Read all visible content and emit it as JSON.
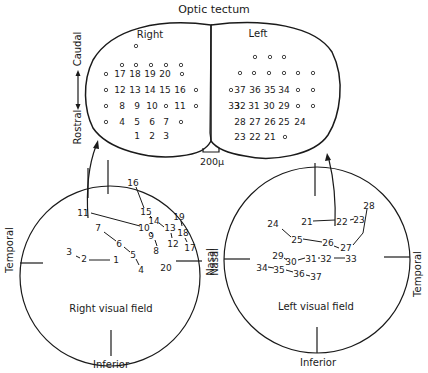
{
  "title": "Optic tectum",
  "tectum": {
    "right_label": "Right",
    "left_label": "Left",
    "axis_caudal": "Caudal",
    "axis_rostral": "Rostral",
    "scale_label": "200μ",
    "right_rows": [
      {
        "y": 49,
        "items": [
          {
            "x": 136,
            "t": "o"
          }
        ]
      },
      {
        "y": 68,
        "items": [
          {
            "x": 122,
            "t": "o"
          },
          {
            "x": 136,
            "t": "o"
          },
          {
            "x": 151,
            "t": "o"
          },
          {
            "x": 166,
            "t": "o"
          },
          {
            "x": 181,
            "t": "o"
          }
        ]
      },
      {
        "y": 77,
        "items": [
          {
            "x": 106,
            "t": "o"
          },
          {
            "x": 120,
            "t": "17"
          },
          {
            "x": 135,
            "t": "18"
          },
          {
            "x": 150,
            "t": "19"
          },
          {
            "x": 165,
            "t": "20"
          },
          {
            "x": 182,
            "t": "o"
          }
        ]
      },
      {
        "y": 93,
        "items": [
          {
            "x": 106,
            "t": "o"
          },
          {
            "x": 120,
            "t": "12"
          },
          {
            "x": 135,
            "t": "13"
          },
          {
            "x": 150,
            "t": "14"
          },
          {
            "x": 165,
            "t": "15"
          },
          {
            "x": 180,
            "t": "16"
          },
          {
            "x": 196,
            "t": "o"
          }
        ]
      },
      {
        "y": 109,
        "items": [
          {
            "x": 106,
            "t": "o"
          },
          {
            "x": 122,
            "t": "8"
          },
          {
            "x": 137,
            "t": "9"
          },
          {
            "x": 152,
            "t": "10"
          },
          {
            "x": 166,
            "t": "o"
          },
          {
            "x": 180,
            "t": "11"
          },
          {
            "x": 196,
            "t": "o"
          }
        ]
      },
      {
        "y": 125,
        "items": [
          {
            "x": 106,
            "t": "o"
          },
          {
            "x": 122,
            "t": "4"
          },
          {
            "x": 137,
            "t": "5"
          },
          {
            "x": 152,
            "t": "6"
          },
          {
            "x": 166,
            "t": "7"
          },
          {
            "x": 181,
            "t": "o"
          }
        ]
      },
      {
        "y": 139,
        "items": [
          {
            "x": 137,
            "t": "1"
          },
          {
            "x": 152,
            "t": "2"
          },
          {
            "x": 166,
            "t": "3"
          }
        ]
      }
    ],
    "left_rows": [
      {
        "y": 60,
        "items": [
          {
            "x": 255,
            "t": "o"
          },
          {
            "x": 270,
            "t": "o"
          },
          {
            "x": 284,
            "t": "o"
          }
        ]
      },
      {
        "y": 76,
        "items": [
          {
            "x": 240,
            "t": "o"
          },
          {
            "x": 254,
            "t": "o"
          },
          {
            "x": 269,
            "t": "o"
          },
          {
            "x": 284,
            "t": "o"
          },
          {
            "x": 298,
            "t": "o"
          },
          {
            "x": 313,
            "t": "o"
          }
        ]
      },
      {
        "y": 93,
        "items": [
          {
            "x": 231,
            "t": "o"
          },
          {
            "x": 240,
            "t": "37"
          },
          {
            "x": 255,
            "t": "36"
          },
          {
            "x": 270,
            "t": "35"
          },
          {
            "x": 284,
            "t": "34"
          },
          {
            "x": 298,
            "t": "o"
          },
          {
            "x": 313,
            "t": "o"
          }
        ]
      },
      {
        "y": 109,
        "items": [
          {
            "x": 240,
            "t": "32"
          },
          {
            "x": 254,
            "t": "31"
          },
          {
            "x": 269,
            "t": "30"
          },
          {
            "x": 284,
            "t": "29"
          },
          {
            "x": 298,
            "t": "o"
          },
          {
            "x": 313,
            "t": "o"
          }
        ]
      },
      {
        "y": 125,
        "items": [
          {
            "x": 240,
            "t": "28"
          },
          {
            "x": 255,
            "t": "27"
          },
          {
            "x": 270,
            "t": "26"
          },
          {
            "x": 284,
            "t": "25"
          },
          {
            "x": 300,
            "t": "24"
          },
          {
            "x": 299,
            "t": ""
          }
        ]
      },
      {
        "y": 140,
        "items": [
          {
            "x": 240,
            "t": "23"
          },
          {
            "x": 255,
            "t": "22"
          },
          {
            "x": 270,
            "t": "21"
          },
          {
            "x": 285,
            "t": "o"
          }
        ]
      }
    ],
    "left_extra": [
      {
        "x": 234,
        "y": 109,
        "t": "33"
      }
    ]
  },
  "right_field": {
    "label": "Right visual field",
    "temporal": "Temporal",
    "nasal": "Nasal",
    "inferior": "Inferior",
    "points": [
      {
        "n": "1",
        "x": 116,
        "y": 260
      },
      {
        "n": "2",
        "x": 84,
        "y": 259
      },
      {
        "n": "3",
        "x": 69,
        "y": 252
      },
      {
        "n": "4",
        "x": 141,
        "y": 270
      },
      {
        "n": "5",
        "x": 133,
        "y": 255
      },
      {
        "n": "6",
        "x": 119,
        "y": 244
      },
      {
        "n": "7",
        "x": 98,
        "y": 228
      },
      {
        "n": "8",
        "x": 156,
        "y": 251
      },
      {
        "n": "9",
        "x": 151,
        "y": 236
      },
      {
        "n": "10",
        "x": 144,
        "y": 228
      },
      {
        "n": "11",
        "x": 83,
        "y": 213
      },
      {
        "n": "12",
        "x": 173,
        "y": 244
      },
      {
        "n": "13",
        "x": 170,
        "y": 228
      },
      {
        "n": "14",
        "x": 154,
        "y": 221
      },
      {
        "n": "15",
        "x": 146,
        "y": 212
      },
      {
        "n": "16",
        "x": 133,
        "y": 183
      },
      {
        "n": "17",
        "x": 190,
        "y": 248
      },
      {
        "n": "18",
        "x": 183,
        "y": 233
      },
      {
        "n": "19",
        "x": 179,
        "y": 217
      },
      {
        "n": "20",
        "x": 166,
        "y": 268
      }
    ],
    "segments": [
      [
        76,
        256,
        80,
        258
      ],
      [
        89,
        260,
        110,
        260
      ],
      [
        104,
        232,
        116,
        241
      ],
      [
        124,
        247,
        130,
        252
      ],
      [
        136,
        259,
        139,
        265
      ],
      [
        91,
        213,
        140,
        226
      ],
      [
        150,
        232,
        152,
        234
      ],
      [
        155,
        240,
        157,
        246
      ],
      [
        136,
        187,
        144,
        208
      ],
      [
        150,
        216,
        152,
        218
      ],
      [
        159,
        223,
        164,
        227
      ],
      [
        171,
        233,
        172,
        238
      ],
      [
        181,
        221,
        182,
        226
      ],
      [
        185,
        238,
        187,
        242
      ]
    ]
  },
  "left_field": {
    "label": "Left visual field",
    "nasal": "Nasal",
    "temporal": "Temporal",
    "inferior": "Inferior",
    "points": [
      {
        "n": "21",
        "x": 307,
        "y": 222
      },
      {
        "n": "22",
        "x": 342,
        "y": 222
      },
      {
        "n": "23",
        "x": 359,
        "y": 220
      },
      {
        "n": "24",
        "x": 273,
        "y": 224
      },
      {
        "n": "25",
        "x": 297,
        "y": 240
      },
      {
        "n": "26",
        "x": 328,
        "y": 243
      },
      {
        "n": "27",
        "x": 346,
        "y": 248
      },
      {
        "n": "28",
        "x": 369,
        "y": 206
      },
      {
        "n": "29",
        "x": 278,
        "y": 256
      },
      {
        "n": "30",
        "x": 291,
        "y": 262
      },
      {
        "n": "31",
        "x": 311,
        "y": 259
      },
      {
        "n": "32",
        "x": 326,
        "y": 259
      },
      {
        "n": "33",
        "x": 351,
        "y": 259
      },
      {
        "n": "34",
        "x": 262,
        "y": 268
      },
      {
        "n": "35",
        "x": 279,
        "y": 270
      },
      {
        "n": "36",
        "x": 299,
        "y": 274
      },
      {
        "n": "37",
        "x": 316,
        "y": 277
      }
    ],
    "segments": [
      [
        313,
        221,
        335,
        220
      ],
      [
        350,
        220,
        354,
        219
      ],
      [
        282,
        229,
        291,
        237
      ],
      [
        303,
        239,
        322,
        242
      ],
      [
        334,
        246,
        339,
        248
      ],
      [
        353,
        245,
        363,
        233
      ],
      [
        363,
        233,
        367,
        209
      ],
      [
        284,
        258,
        287,
        260
      ],
      [
        298,
        260,
        305,
        258
      ],
      [
        318,
        258,
        320,
        258
      ],
      [
        334,
        258,
        345,
        258
      ],
      [
        268,
        267,
        274,
        268
      ],
      [
        286,
        270,
        293,
        272
      ],
      [
        306,
        275,
        310,
        276
      ]
    ]
  }
}
